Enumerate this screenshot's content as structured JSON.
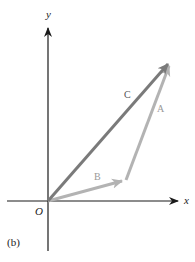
{
  "figure": {
    "panel_label": "(b)",
    "axes": {
      "x_label": "x",
      "y_label": "y",
      "origin_label": "O",
      "axis_color": "#1a1a1a"
    },
    "vectors": [
      {
        "name": "A",
        "label": "A",
        "from": "tip of B",
        "to": "tip of C",
        "color": "#b3b3b3"
      },
      {
        "name": "B",
        "label": "B",
        "from": "O",
        "to": "end of B",
        "color": "#b3b3b3"
      },
      {
        "name": "C",
        "label": "C",
        "from": "O",
        "to": "tip of A",
        "color": "#7a7a7a"
      }
    ]
  }
}
